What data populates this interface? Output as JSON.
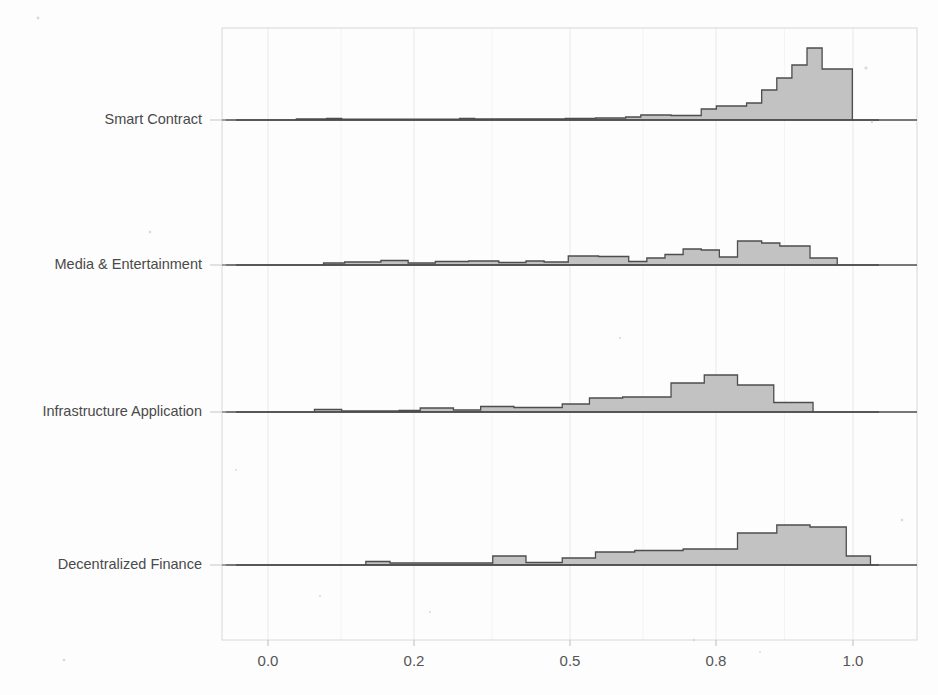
{
  "figure": {
    "width": 938,
    "height": 695,
    "background": "#fdfdfd",
    "type": "ridgeline-histogram"
  },
  "axis": {
    "tick_labels": [
      "0.0",
      "0.2",
      "0.5",
      "0.8",
      "1.0"
    ],
    "tick_values": [
      0.0,
      0.2,
      0.5,
      0.8,
      1.0
    ],
    "tick_pixel_x": [
      268,
      414,
      570,
      716,
      853
    ],
    "xlabel": "",
    "ylabel": "",
    "xlim": [
      -0.063,
      1.087
    ],
    "grid": true,
    "frame": {
      "x0": 222,
      "y0": 28,
      "x1": 917,
      "y1": 640
    }
  },
  "style": {
    "fill_color": "#c2c2c2",
    "line_color": "#4d4d4d",
    "grid_color": "#e9e9e9",
    "frame_color": "#d8d8d8",
    "label_color": "#4a4a4a",
    "tick_color": "#555555"
  },
  "chart_data": {
    "type": "area",
    "title": "",
    "xlabel": "",
    "ylabel": "",
    "xlim": [
      -0.063,
      1.087
    ],
    "grid": true,
    "legend": "none",
    "categories": [
      "Smart Contract",
      "Media & Entertainment",
      "Infrastructure Application",
      "Decentralized Finance"
    ],
    "baseline_pixel_y": [
      120,
      265,
      412,
      565
    ],
    "bin_width": 0.025,
    "series": [
      {
        "name": "Smart Contract",
        "baseline_y": 120,
        "bins": [
          {
            "x0": -0.063,
            "x1": 0.06,
            "h": 0.0
          },
          {
            "x0": 0.06,
            "x1": 0.085,
            "h": 1.0
          },
          {
            "x0": 0.085,
            "x1": 0.11,
            "h": 1.0
          },
          {
            "x0": 0.11,
            "x1": 0.135,
            "h": 1.5
          },
          {
            "x0": 0.135,
            "x1": 0.33,
            "h": 0.8
          },
          {
            "x0": 0.33,
            "x1": 0.355,
            "h": 1.6
          },
          {
            "x0": 0.355,
            "x1": 0.38,
            "h": 1.0
          },
          {
            "x0": 0.38,
            "x1": 0.505,
            "h": 1.2
          },
          {
            "x0": 0.505,
            "x1": 0.555,
            "h": 1.6
          },
          {
            "x0": 0.555,
            "x1": 0.605,
            "h": 2.0
          },
          {
            "x0": 0.605,
            "x1": 0.63,
            "h": 3.0
          },
          {
            "x0": 0.63,
            "x1": 0.68,
            "h": 5.0
          },
          {
            "x0": 0.68,
            "x1": 0.73,
            "h": 4.5
          },
          {
            "x0": 0.73,
            "x1": 0.755,
            "h": 11.0
          },
          {
            "x0": 0.755,
            "x1": 0.805,
            "h": 14.0
          },
          {
            "x0": 0.805,
            "x1": 0.83,
            "h": 17.0
          },
          {
            "x0": 0.83,
            "x1": 0.855,
            "h": 30.0
          },
          {
            "x0": 0.855,
            "x1": 0.88,
            "h": 42.0
          },
          {
            "x0": 0.88,
            "x1": 0.905,
            "h": 55.0
          },
          {
            "x0": 0.905,
            "x1": 0.93,
            "h": 72.0
          },
          {
            "x0": 0.93,
            "x1": 0.98,
            "h": 51.0
          },
          {
            "x0": 0.98,
            "x1": 1.087,
            "h": 0.0
          }
        ]
      },
      {
        "name": "Media & Entertainment",
        "baseline_y": 265,
        "bins": [
          {
            "x0": -0.063,
            "x1": 0.105,
            "h": 0.0
          },
          {
            "x0": 0.105,
            "x1": 0.14,
            "h": 2.0
          },
          {
            "x0": 0.14,
            "x1": 0.2,
            "h": 3.0
          },
          {
            "x0": 0.2,
            "x1": 0.245,
            "h": 4.5
          },
          {
            "x0": 0.245,
            "x1": 0.29,
            "h": 2.0
          },
          {
            "x0": 0.29,
            "x1": 0.345,
            "h": 3.5
          },
          {
            "x0": 0.345,
            "x1": 0.395,
            "h": 4.0
          },
          {
            "x0": 0.395,
            "x1": 0.44,
            "h": 2.5
          },
          {
            "x0": 0.44,
            "x1": 0.47,
            "h": 4.0
          },
          {
            "x0": 0.47,
            "x1": 0.51,
            "h": 3.0
          },
          {
            "x0": 0.51,
            "x1": 0.56,
            "h": 9.0
          },
          {
            "x0": 0.56,
            "x1": 0.61,
            "h": 8.5
          },
          {
            "x0": 0.61,
            "x1": 0.64,
            "h": 3.5
          },
          {
            "x0": 0.64,
            "x1": 0.67,
            "h": 7.0
          },
          {
            "x0": 0.67,
            "x1": 0.7,
            "h": 10.5
          },
          {
            "x0": 0.7,
            "x1": 0.73,
            "h": 16.0
          },
          {
            "x0": 0.73,
            "x1": 0.76,
            "h": 15.0
          },
          {
            "x0": 0.76,
            "x1": 0.79,
            "h": 8.0
          },
          {
            "x0": 0.79,
            "x1": 0.83,
            "h": 24.0
          },
          {
            "x0": 0.83,
            "x1": 0.86,
            "h": 22.0
          },
          {
            "x0": 0.86,
            "x1": 0.91,
            "h": 19.0
          },
          {
            "x0": 0.91,
            "x1": 0.955,
            "h": 7.0
          },
          {
            "x0": 0.955,
            "x1": 1.087,
            "h": 0.0
          }
        ]
      },
      {
        "name": "Infrastructure Application",
        "baseline_y": 412,
        "bins": [
          {
            "x0": -0.063,
            "x1": 0.09,
            "h": 0.0
          },
          {
            "x0": 0.09,
            "x1": 0.135,
            "h": 2.5
          },
          {
            "x0": 0.135,
            "x1": 0.23,
            "h": 1.0
          },
          {
            "x0": 0.23,
            "x1": 0.265,
            "h": 1.5
          },
          {
            "x0": 0.265,
            "x1": 0.32,
            "h": 4.0
          },
          {
            "x0": 0.32,
            "x1": 0.365,
            "h": 2.0
          },
          {
            "x0": 0.365,
            "x1": 0.42,
            "h": 5.5
          },
          {
            "x0": 0.42,
            "x1": 0.5,
            "h": 4.5
          },
          {
            "x0": 0.5,
            "x1": 0.545,
            "h": 8.0
          },
          {
            "x0": 0.545,
            "x1": 0.6,
            "h": 14.0
          },
          {
            "x0": 0.6,
            "x1": 0.68,
            "h": 15.0
          },
          {
            "x0": 0.68,
            "x1": 0.735,
            "h": 29.0
          },
          {
            "x0": 0.735,
            "x1": 0.79,
            "h": 37.0
          },
          {
            "x0": 0.79,
            "x1": 0.85,
            "h": 27.0
          },
          {
            "x0": 0.85,
            "x1": 0.915,
            "h": 9.5
          },
          {
            "x0": 0.915,
            "x1": 1.087,
            "h": 0.0
          }
        ]
      },
      {
        "name": "Decentralized Finance",
        "baseline_y": 565,
        "bins": [
          {
            "x0": -0.063,
            "x1": 0.175,
            "h": 0.0
          },
          {
            "x0": 0.175,
            "x1": 0.215,
            "h": 3.5
          },
          {
            "x0": 0.215,
            "x1": 0.385,
            "h": 2.0
          },
          {
            "x0": 0.385,
            "x1": 0.44,
            "h": 9.0
          },
          {
            "x0": 0.44,
            "x1": 0.5,
            "h": 2.5
          },
          {
            "x0": 0.5,
            "x1": 0.555,
            "h": 7.0
          },
          {
            "x0": 0.555,
            "x1": 0.62,
            "h": 13.0
          },
          {
            "x0": 0.62,
            "x1": 0.7,
            "h": 14.5
          },
          {
            "x0": 0.7,
            "x1": 0.79,
            "h": 16.0
          },
          {
            "x0": 0.79,
            "x1": 0.855,
            "h": 32.0
          },
          {
            "x0": 0.855,
            "x1": 0.91,
            "h": 40.0
          },
          {
            "x0": 0.91,
            "x1": 0.97,
            "h": 38.0
          },
          {
            "x0": 0.97,
            "x1": 1.01,
            "h": 9.0
          },
          {
            "x0": 1.01,
            "x1": 1.087,
            "h": 0.0
          }
        ]
      }
    ]
  }
}
